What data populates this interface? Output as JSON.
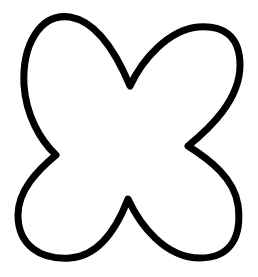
{
  "figure": {
    "stroke_color": "#000000",
    "fill_color": "#ffffff",
    "background_color": "#ffffff",
    "stroke_width": 7
  }
}
